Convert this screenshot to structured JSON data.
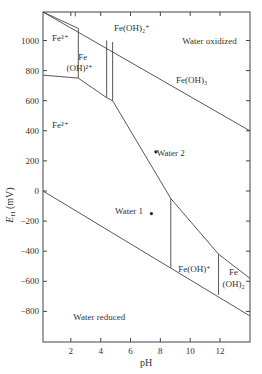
{
  "chart_data": {
    "type": "diagram",
    "title": "",
    "xlabel": "pH",
    "ylabel": "E_H (mV)",
    "xlim": [
      0,
      14
    ],
    "ylim": [
      -1000,
      1200
    ],
    "x_ticks": [
      2,
      4,
      6,
      8,
      10,
      12
    ],
    "y_ticks": [
      1000,
      800,
      600,
      400,
      200,
      0,
      -200,
      -400,
      -600,
      -800
    ],
    "grid": false,
    "legend": "none",
    "boundaries": [
      {
        "name": "water-oxidized-line",
        "points": [
          [
            0,
            1230
          ],
          [
            14,
            400
          ]
        ]
      },
      {
        "name": "water-reduced-line",
        "points": [
          [
            0,
            0
          ],
          [
            14,
            -830
          ]
        ]
      },
      {
        "name": "fe3-fe2-line",
        "points": [
          [
            0,
            770
          ],
          [
            2.5,
            750
          ]
        ]
      },
      {
        "name": "fe3-feoh2-vertical",
        "points": [
          [
            2.5,
            750
          ],
          [
            2.5,
            1080
          ]
        ]
      },
      {
        "name": "fe3-top-line",
        "points": [
          [
            0,
            1240
          ],
          [
            2.5,
            1080
          ]
        ]
      },
      {
        "name": "feoh2-fe2-line",
        "points": [
          [
            2.5,
            750
          ],
          [
            4.4,
            620
          ]
        ]
      },
      {
        "name": "feoh2-feoh2plus-vertical-1",
        "points": [
          [
            4.4,
            620
          ],
          [
            4.4,
            1000
          ]
        ]
      },
      {
        "name": "feoh2plus-vertical-2",
        "points": [
          [
            4.8,
            600
          ],
          [
            4.8,
            990
          ]
        ]
      },
      {
        "name": "feoh2plus-bottom",
        "points": [
          [
            4.4,
            620
          ],
          [
            4.8,
            600
          ]
        ]
      },
      {
        "name": "feoh3-fe2-line",
        "points": [
          [
            4.8,
            600
          ],
          [
            8.7,
            -50
          ]
        ]
      },
      {
        "name": "feoh-vertical",
        "points": [
          [
            8.7,
            -50
          ],
          [
            8.7,
            -510
          ]
        ]
      },
      {
        "name": "feoh3-feoh-line",
        "points": [
          [
            8.7,
            -50
          ],
          [
            11.9,
            -420
          ]
        ]
      },
      {
        "name": "feoh-feoh2-vertical",
        "points": [
          [
            11.9,
            -420
          ],
          [
            11.9,
            -690
          ]
        ]
      },
      {
        "name": "feoh3-feoh2-line",
        "points": [
          [
            11.9,
            -420
          ],
          [
            14,
            -580
          ]
        ]
      },
      {
        "name": "fe3-top-tick",
        "points": [
          [
            2.3,
            1200
          ],
          [
            2.3,
            1160
          ]
        ]
      }
    ],
    "regions": [
      {
        "label": "Fe³⁺",
        "x": 1.3,
        "y": 1000
      },
      {
        "label": "Fe",
        "x": 2.8,
        "y": 870
      },
      {
        "label": "(OH)²⁺",
        "x": 2.6,
        "y": 800
      },
      {
        "label": "Fe(OH)₂⁺",
        "x": 6.1,
        "y": 1060
      },
      {
        "label": "Water oxidized",
        "x": 11.3,
        "y": 980
      },
      {
        "label": "Fe(OH)₃",
        "x": 10.1,
        "y": 720
      },
      {
        "label": "Fe²⁺",
        "x": 1.3,
        "y": 420
      },
      {
        "label": "Water 2",
        "x": 8.7,
        "y": 230
      },
      {
        "label": "Water 1",
        "x": 5.9,
        "y": -155
      },
      {
        "label": "Fe(OH)⁺",
        "x": 10.3,
        "y": -540
      },
      {
        "label": "Fe",
        "x": 12.9,
        "y": -560
      },
      {
        "label": "(OH)₂",
        "x": 12.9,
        "y": -640
      },
      {
        "label": "Water reduced",
        "x": 3.9,
        "y": -860
      }
    ],
    "points": [
      {
        "name": "Water 2",
        "x": 7.7,
        "y": 260
      },
      {
        "name": "Water 1",
        "x": 7.4,
        "y": -150
      }
    ]
  },
  "labels": {
    "x_axis": "pH",
    "y_axis_main": "E",
    "y_axis_sub": "H",
    "y_axis_unit": " (mV)"
  }
}
